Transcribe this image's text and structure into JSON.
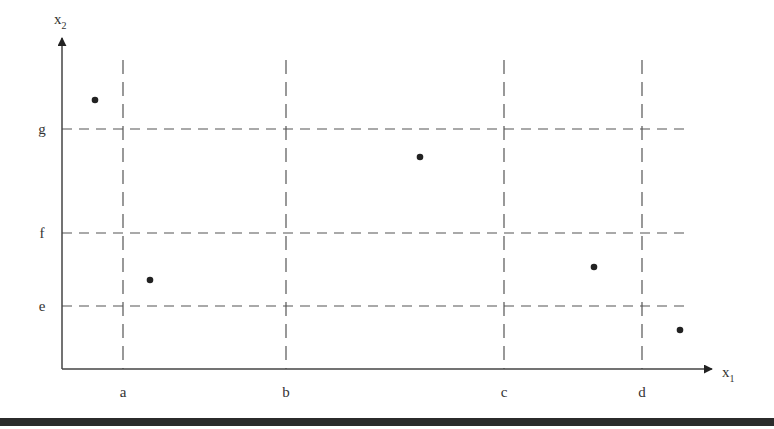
{
  "chart_data": {
    "type": "scatter",
    "title": "",
    "xlabel": "x1",
    "ylabel": "x2",
    "x_axis": {
      "label": "x",
      "subscript": "1"
    },
    "y_axis": {
      "label": "x",
      "subscript": "2"
    },
    "x_thresholds": [
      {
        "label": "a",
        "px": 123
      },
      {
        "label": "b",
        "px": 286
      },
      {
        "label": "c",
        "px": 504
      },
      {
        "label": "d",
        "px": 642
      }
    ],
    "y_thresholds": [
      {
        "label": "g",
        "px": 129
      },
      {
        "label": "f",
        "px": 233
      },
      {
        "label": "e",
        "px": 306
      }
    ],
    "points": [
      {
        "px": 95,
        "py": 100,
        "region": "x1 < a, x2 > g"
      },
      {
        "px": 150,
        "py": 280,
        "region": "a < x1 < b, e < x2 < f"
      },
      {
        "px": 420,
        "py": 157,
        "region": "b < x1 < c, f < x2 < g"
      },
      {
        "px": 594,
        "py": 267,
        "region": "c < x1 < d, e < x2 < f"
      },
      {
        "px": 680,
        "py": 330,
        "region": "x1 > d, x2 < e"
      }
    ],
    "grid": "dashed partition lines at thresholds",
    "legend": null
  },
  "colors": {
    "axis": "#444444",
    "dash": "#555555",
    "point": "#222222",
    "bar": "#2b2b2b"
  }
}
